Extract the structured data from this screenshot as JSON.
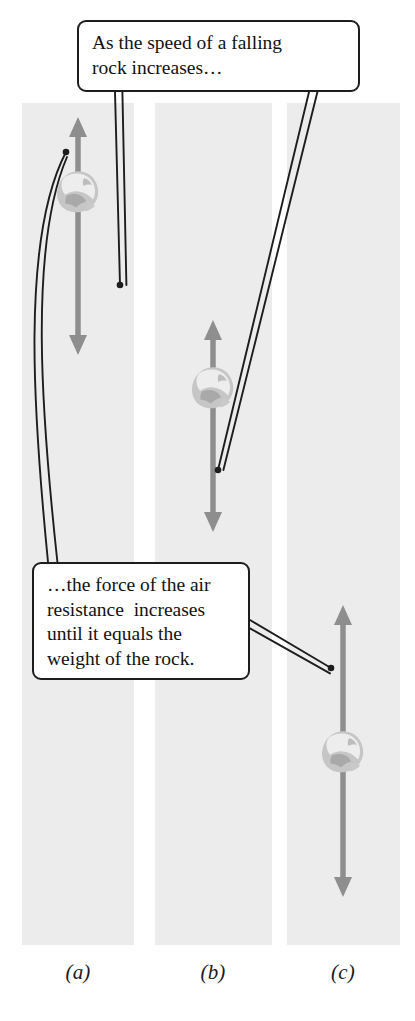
{
  "figure": {
    "type": "physics-free-body-diagram",
    "background_color": "#ececec",
    "page_color": "#ffffff",
    "arrow_color": "#8e8e8e",
    "rock_color": "#b9b9b9",
    "leader_color": "#1d1d1d",
    "text_color": "#121212"
  },
  "callouts": [
    {
      "id": "callout-top",
      "lines": [
        "As the speed of a falling",
        "rock increases…"
      ],
      "text": "As the speed of a falling rock increases…",
      "box": {
        "x": 77,
        "y": 20,
        "w": 283,
        "h": 72
      }
    },
    {
      "id": "callout-bottom",
      "lines": [
        "…the force of the air",
        "resistance  increases",
        "until it equals the",
        "weight of the rock."
      ],
      "text": "…the force of the air resistance  increases until it equals the weight of the rock.",
      "box": {
        "x": 32,
        "y": 562,
        "w": 218,
        "h": 118
      }
    }
  ],
  "panels": [
    {
      "id": "panel-a",
      "label": "(a)",
      "label_x": 78,
      "label_y": 962,
      "rect": {
        "x": 22,
        "y": 103,
        "w": 112,
        "h": 842
      },
      "arrow": {
        "x": 78,
        "y_top": 117,
        "y_bottom": 355,
        "heads": "both"
      },
      "rock": {
        "cx": 78,
        "cy": 192,
        "r": 22
      },
      "leader_dot": {
        "x": 66,
        "y": 152
      }
    },
    {
      "id": "panel-b",
      "label": "(b)",
      "label_x": 213,
      "label_y": 962,
      "rect": {
        "x": 155,
        "y": 103,
        "w": 117,
        "h": 842
      },
      "arrow": {
        "x": 213,
        "y_top": 320,
        "y_bottom": 532,
        "heads": "both"
      },
      "rock": {
        "cx": 213,
        "cy": 388,
        "r": 22
      },
      "leader_dot": {
        "x": 218,
        "y": 470
      }
    },
    {
      "id": "panel-c",
      "label": "(c)",
      "label_x": 343,
      "label_y": 962,
      "rect": {
        "x": 287,
        "y": 103,
        "w": 113,
        "h": 842
      },
      "arrow": {
        "x": 343,
        "y_top": 605,
        "y_bottom": 897,
        "heads": "both"
      },
      "rock": {
        "cx": 343,
        "cy": 752,
        "r": 22
      },
      "leader_dot": {
        "x": 331,
        "y": 668
      }
    }
  ],
  "leaders": [
    {
      "id": "leader-top-to-panel-a",
      "from": "callout-top",
      "to": "panel-a"
    },
    {
      "id": "leader-top-to-panel-b",
      "from": "callout-top",
      "to": "panel-b"
    },
    {
      "id": "leader-bottom-to-panel-a",
      "from": "callout-bottom",
      "to": "panel-a"
    },
    {
      "id": "leader-bottom-to-panel-c",
      "from": "callout-bottom",
      "to": "panel-c"
    }
  ]
}
